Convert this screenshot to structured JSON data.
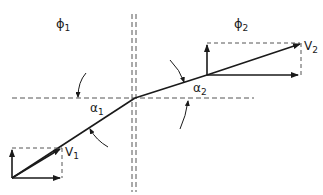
{
  "diagram": {
    "colors": {
      "line": "#1a1a1a",
      "dashed": "#555555",
      "background": "#ffffff"
    },
    "regions": [
      {
        "id": "left",
        "label": "ϕ",
        "subscript": "1"
      },
      {
        "id": "right",
        "label": "ϕ",
        "subscript": "2"
      }
    ],
    "vectors": [
      {
        "id": "v1",
        "label": "V",
        "subscript": "1"
      },
      {
        "id": "v2",
        "label": "V",
        "subscript": "2"
      }
    ],
    "angles": [
      {
        "id": "a1",
        "label": "α",
        "subscript": "1"
      },
      {
        "id": "a2",
        "label": "α",
        "subscript": "2"
      }
    ]
  }
}
